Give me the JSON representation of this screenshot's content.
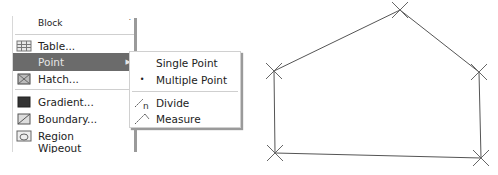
{
  "menu": {
    "items": [
      {
        "label": "Block",
        "icon": "none",
        "has_submenu": true
      },
      {
        "label": "Table...",
        "icon": "table-icon"
      },
      {
        "label": "Point",
        "icon": "none",
        "has_submenu": true,
        "highlighted": true
      },
      {
        "label": "Hatch...",
        "icon": "hatch-icon"
      },
      {
        "label": "Gradient...",
        "icon": "gradient-icon"
      },
      {
        "label": "Boundary...",
        "icon": "boundary-icon"
      },
      {
        "label": "Region",
        "icon": "region-icon"
      },
      {
        "label": "Wipeout",
        "icon": "none"
      }
    ]
  },
  "submenu": {
    "items": [
      {
        "label": "Single Point",
        "icon": "none"
      },
      {
        "label": "Multiple Point",
        "icon": "bullet-icon"
      },
      {
        "label": "Divide",
        "icon": "divide-icon"
      },
      {
        "label": "Measure",
        "icon": "measure-icon"
      }
    ]
  },
  "drawing": {
    "polygon_points": [
      {
        "name": "top",
        "x": 400,
        "y": 10
      },
      {
        "name": "right-mid",
        "x": 479,
        "y": 72
      },
      {
        "name": "bottom-right",
        "x": 481,
        "y": 158
      },
      {
        "name": "bottom-left",
        "x": 275,
        "y": 153
      },
      {
        "name": "left-mid",
        "x": 274,
        "y": 71
      }
    ]
  }
}
